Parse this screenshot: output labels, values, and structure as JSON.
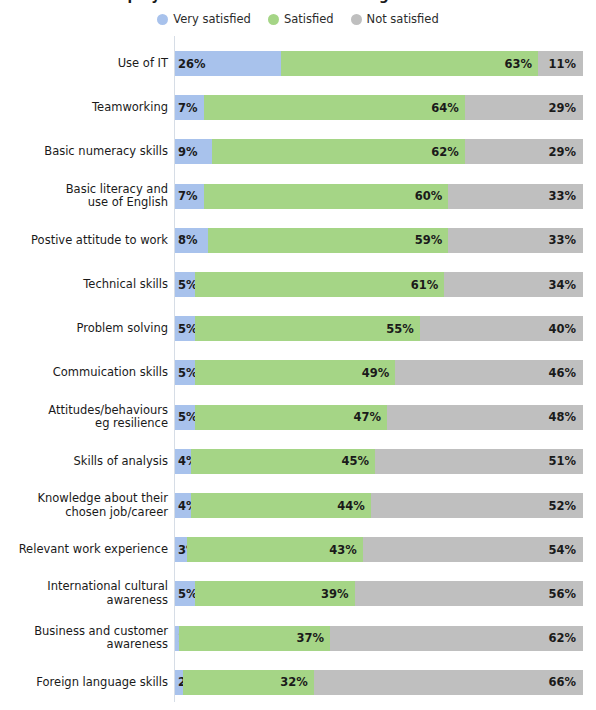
{
  "title": {
    "text": "Employer satisfaction with skills of graduates"
  },
  "legend": {
    "position": "top-center",
    "items": [
      {
        "label": "Very satisfied",
        "color": "#A8C2EC",
        "icon": "circle-swatch-icon"
      },
      {
        "label": "Satisfied",
        "color": "#A5D586",
        "icon": "circle-swatch-icon"
      },
      {
        "label": "Not satisfied",
        "color": "#BFBFBF",
        "icon": "circle-swatch-icon"
      }
    ]
  },
  "colors": {
    "very_satisfied": "#A8C2EC",
    "satisfied": "#A5D586",
    "not_satisfied": "#BFBFBF",
    "axis_line": "#d6dde6",
    "text": "#1a1a1a",
    "background": "#ffffff"
  },
  "chart_data": {
    "type": "bar",
    "orientation": "horizontal",
    "stacked": true,
    "normalized": "100%",
    "title": "Employer satisfaction with skills of graduates",
    "xlabel": "",
    "ylabel": "",
    "xlim": [
      0,
      100
    ],
    "grid": false,
    "legend_position": "top-center",
    "categories": [
      "Use of IT",
      "Teamworking",
      "Basic numeracy skills",
      "Basic literacy and\nuse of English",
      "Postive attitude to work",
      "Technical skills",
      "Problem solving",
      "Commuication skills",
      "Attitudes/behaviours\neg resilience",
      "Skills of analysis",
      "Knowledge about their\nchosen job/career",
      "Relevant work experience",
      "International cultural\nawareness",
      "Business and customer\nawareness",
      "Foreign language skills"
    ],
    "series": [
      {
        "name": "Very satisfied",
        "color": "#A8C2EC",
        "values": [
          26,
          7,
          9,
          7,
          8,
          5,
          5,
          5,
          5,
          4,
          4,
          3,
          5,
          1,
          2
        ],
        "labels": [
          "26%",
          "7%",
          "9%",
          "7%",
          "8%",
          "5%",
          "5%",
          "5%",
          "5%",
          "4%",
          "4%",
          "3%",
          "5%",
          "1%",
          "2%"
        ]
      },
      {
        "name": "Satisfied",
        "color": "#A5D586",
        "values": [
          63,
          64,
          62,
          60,
          59,
          61,
          55,
          49,
          47,
          45,
          44,
          43,
          39,
          37,
          32
        ],
        "labels": [
          "63%",
          "64%",
          "62%",
          "60%",
          "59%",
          "61%",
          "55%",
          "49%",
          "47%",
          "45%",
          "44%",
          "43%",
          "39%",
          "37%",
          "32%"
        ]
      },
      {
        "name": "Not satisfied",
        "color": "#BFBFBF",
        "values": [
          11,
          29,
          29,
          33,
          33,
          34,
          40,
          46,
          48,
          51,
          52,
          54,
          56,
          62,
          66
        ],
        "labels": [
          "11%",
          "29%",
          "29%",
          "33%",
          "33%",
          "34%",
          "40%",
          "46%",
          "48%",
          "51%",
          "52%",
          "54%",
          "56%",
          "62%",
          "66%"
        ]
      }
    ]
  }
}
